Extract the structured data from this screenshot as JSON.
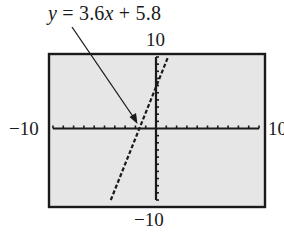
{
  "annotation": {
    "equation_prefix": "y",
    "equation_equals": " = 3.6",
    "equation_var": "x",
    "equation_suffix": " + 5.8",
    "equation_full": "y = 3.6x + 5.8"
  },
  "window": {
    "xmin_label": "−10",
    "xmax_label": "10",
    "ymin_label": "−10",
    "ymax_label": "10"
  },
  "colors": {
    "screen_bg": "#e6e6e6",
    "frame": "#1a1a1a",
    "axis": "#1a1a1a",
    "line": "#1a1a1a",
    "page_bg": "#ffffff"
  },
  "chart_data": {
    "type": "line",
    "title": "",
    "annotation": "y = 3.6x + 5.8",
    "xlabel": "",
    "ylabel": "",
    "xlim": [
      -10,
      10
    ],
    "ylim": [
      -10,
      10
    ],
    "xscale": 1,
    "yscale": 1,
    "grid": false,
    "tick_labels": {
      "xmin": "−10",
      "xmax": "10",
      "ymin": "−10",
      "ymax": "10"
    },
    "series": [
      {
        "name": "y = 3.6x + 5.8",
        "slope": 3.6,
        "intercept": 5.8,
        "x": [
          -4.389,
          -1.611,
          0,
          1.167
        ],
        "y": [
          -10,
          0,
          5.8,
          10
        ],
        "style": "dashed (calculator pixel rendering)"
      }
    ],
    "x_intercept": -1.611,
    "y_intercept": 5.8
  }
}
